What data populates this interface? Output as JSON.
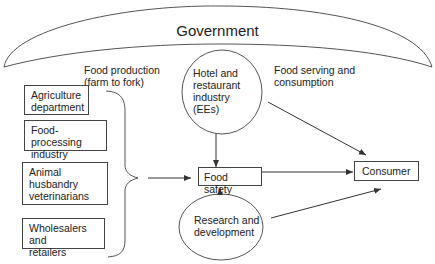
{
  "government": {
    "label": "Government"
  },
  "section_labels": {
    "food_production": "Food production\n(farm to fork)",
    "food_serving": "Food serving and\nconsumption"
  },
  "left_boxes": [
    {
      "label": "Agriculture\ndepartment"
    },
    {
      "label": "Food-processing\nindustry"
    },
    {
      "label": "Animal\nhusbandry\nveterinarians"
    },
    {
      "label": "Wholesalers and\nretailers"
    }
  ],
  "ellipses": {
    "hotel": "Hotel and\nrestaurant\nindustry\n(EEs)",
    "research": "Research and\ndevelopment"
  },
  "center_box": {
    "label": "Food safety"
  },
  "consumer_box": {
    "label": "Consumer"
  },
  "colors": {
    "stroke": "#444444",
    "text": "#222222",
    "background": "#ffffff"
  }
}
